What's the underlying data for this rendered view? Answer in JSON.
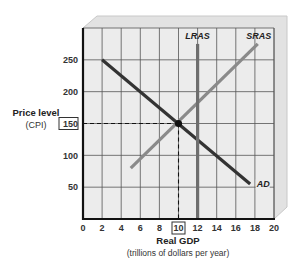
{
  "chart_data": {
    "type": "line",
    "title": "",
    "xlabel": "Real GDP",
    "xlabel_sub": "(trillions of dollars per year)",
    "ylabel": "Price level",
    "ylabel_sub": "(CPI)",
    "xlim": [
      0,
      20
    ],
    "ylim": [
      0,
      300
    ],
    "x_ticks": [
      0,
      2,
      4,
      6,
      8,
      10,
      12,
      14,
      16,
      18,
      20
    ],
    "y_ticks": [
      50,
      100,
      150,
      200,
      250
    ],
    "highlighted_x_tick": 10,
    "highlighted_y_tick": 150,
    "grid": true,
    "series": [
      {
        "name": "AD",
        "label": "AD",
        "color": "#333333",
        "points": [
          [
            2,
            250
          ],
          [
            17.5,
            55
          ]
        ],
        "label_pos": [
          18.4,
          55
        ]
      },
      {
        "name": "SRAS",
        "label": "SRAS",
        "color": "#8a8a8a",
        "points": [
          [
            5,
            80
          ],
          [
            18.3,
            275
          ]
        ],
        "label_pos": [
          18.4,
          285
        ]
      },
      {
        "name": "LRAS",
        "label": "LRAS",
        "color": "#6e6e6e",
        "points": [
          [
            12,
            0
          ],
          [
            12,
            275
          ]
        ],
        "label_pos": [
          12,
          285
        ]
      }
    ],
    "equilibrium": {
      "x": 10,
      "y": 150,
      "guides": "dashed"
    }
  },
  "labels": {
    "ylabel": "Price level",
    "ylabel_sub": "(CPI)",
    "xlabel": "Real GDP",
    "xlabel_sub": "(trillions of dollars per year)"
  },
  "colors": {
    "plot_background": "#ececec",
    "panel_border": "#c8c8c8",
    "grid": "#555555",
    "axis": "#111111"
  }
}
